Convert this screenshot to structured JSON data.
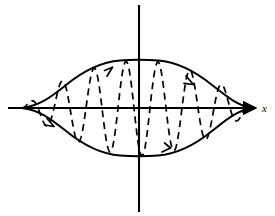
{
  "figure": {
    "title": "",
    "background_color": "#ffffff",
    "stroke_color": "#000000",
    "width": 275,
    "height": 216
  },
  "axes": {
    "x_axis": {
      "label": "x",
      "label_style": "italic",
      "label_x": 263,
      "label_y": 110,
      "start_x": 8,
      "end_x": 258,
      "y": 108,
      "arrow": "right",
      "name": "x-axis"
    },
    "y_axis": {
      "label": "",
      "x": 139,
      "start_y": 5,
      "end_y": 212,
      "arrow": "none",
      "name": "y-axis"
    }
  },
  "chart_data": {
    "type": "line",
    "title": "",
    "xlabel": "x",
    "ylabel": "",
    "grid": false,
    "legend": "none",
    "xlim": [
      22,
      252
    ],
    "ylim": [
      -48,
      48
    ],
    "origin_px": {
      "x": 139,
      "y": 108
    },
    "px_per_unit": {
      "x": 1,
      "y": 1
    },
    "series": [
      {
        "name": "upper envelope",
        "style": "solid",
        "description": "Smooth envelope curve rising from left node to peak at origin abscissa then falling to right node",
        "x": [
          22,
          40,
          60,
          80,
          100,
          120,
          139,
          158,
          178,
          198,
          218,
          236,
          252
        ],
        "values": [
          0,
          14,
          26,
          35,
          42,
          46,
          48,
          46,
          42,
          35,
          26,
          14,
          0
        ]
      },
      {
        "name": "lower envelope",
        "style": "solid",
        "description": "Mirror image of the upper envelope below the x-axis",
        "x": [
          22,
          40,
          60,
          80,
          100,
          120,
          139,
          158,
          178,
          198,
          218,
          236,
          252
        ],
        "values": [
          0,
          -14,
          -26,
          -35,
          -42,
          -46,
          -48,
          -46,
          -42,
          -35,
          -26,
          -14,
          0
        ]
      },
      {
        "name": "oscillation",
        "style": "dashed",
        "description": "Rapidly oscillating curve bounded by the envelopes",
        "period_px": 32,
        "cycles": 7.2,
        "amplitude_profile": "envelope"
      }
    ],
    "annotations": [
      {
        "name": "left-node",
        "x": 22,
        "y": 0,
        "description": "Envelope curves meet on the x-axis"
      },
      {
        "name": "right-node",
        "x": 252,
        "y": 0,
        "description": "Envelope curves meet on the x-axis"
      },
      {
        "name": "direction-arrow-upper-left",
        "description": "Arrowhead on upper envelope pointing up-right"
      },
      {
        "name": "direction-arrow-upper-right",
        "description": "Arrowhead on upper envelope pointing down-right"
      },
      {
        "name": "direction-arrow-lower-left",
        "description": "Arrowhead on lower envelope pointing down-right"
      },
      {
        "name": "direction-arrow-lower-right",
        "description": "Arrowhead on lower envelope pointing up-right"
      }
    ]
  }
}
